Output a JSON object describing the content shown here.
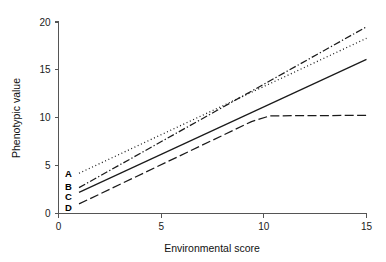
{
  "chart_data": {
    "type": "line",
    "title": "",
    "xlabel": "Environmental score",
    "ylabel": "Phenotypic value",
    "xlim": [
      0,
      15.6
    ],
    "ylim": [
      0,
      21.2
    ],
    "xticks": [
      0,
      5,
      10,
      15
    ],
    "xticklabels": [
      "0",
      "5",
      "10",
      "15"
    ],
    "yticks": [
      0,
      5,
      10,
      15,
      20
    ],
    "yticklabels": [
      "0",
      "5",
      "10",
      "15",
      "20"
    ],
    "grid": false,
    "legend_position": "inline-left-labels",
    "series": [
      {
        "name": "A",
        "label": "A",
        "linestyle": "dotted",
        "dasharray": "1,2.6",
        "color": "#1a1a1a",
        "x": [
          1,
          15
        ],
        "y": [
          4.2,
          18.3
        ],
        "label_x": 1,
        "label_y": 4.2
      },
      {
        "name": "B",
        "label": "B",
        "linestyle": "dash-dot",
        "dasharray": "7,2.2,1.3,2.2",
        "color": "#1a1a1a",
        "x": [
          1,
          15
        ],
        "y": [
          2.7,
          19.5
        ],
        "label_x": 1,
        "label_y": 2.85
      },
      {
        "name": "C",
        "label": "C",
        "linestyle": "solid",
        "dasharray": "none",
        "color": "#1a1a1a",
        "x": [
          1,
          15
        ],
        "y": [
          2.2,
          16.1
        ],
        "label_x": 1,
        "label_y": 1.75
      },
      {
        "name": "D",
        "label": "D",
        "linestyle": "long-dash",
        "dasharray": "9,3.4",
        "color": "#1a1a1a",
        "x": [
          1,
          9.4,
          10.3,
          15
        ],
        "y": [
          1.0,
          9.6,
          10.2,
          10.25
        ],
        "label_x": 1,
        "label_y": 0.6
      }
    ]
  }
}
